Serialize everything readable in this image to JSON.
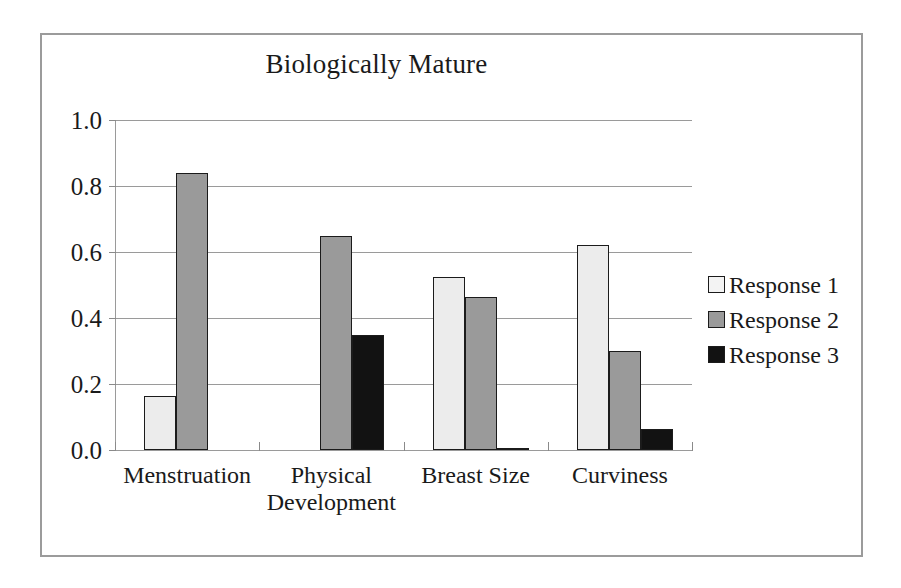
{
  "chart_data": {
    "type": "bar",
    "title": "Biologically Mature",
    "xlabel": "",
    "ylabel": "",
    "ylim": [
      0.0,
      1.0
    ],
    "ytick_labels": [
      "1.0",
      "0.8",
      "0.6",
      "0.4",
      "0.2",
      "0.0"
    ],
    "ytick_values": [
      1.0,
      0.8,
      0.6,
      0.4,
      0.2,
      0.0
    ],
    "grid": true,
    "legend_position": "right",
    "categories": [
      "Menstruation",
      "Physical\nDevelopment",
      "Breast Size",
      "Curviness"
    ],
    "series": [
      {
        "name": "Response 1",
        "color": "#ececec",
        "values": [
          0.165,
          0.0,
          0.525,
          0.62
        ]
      },
      {
        "name": "Response 2",
        "color": "#9a9a9a",
        "values": [
          0.84,
          0.65,
          0.465,
          0.3
        ]
      },
      {
        "name": "Response 3",
        "color": "#121212",
        "values": [
          0.0,
          0.35,
          0.005,
          0.065
        ]
      }
    ]
  },
  "legend": {
    "entries": [
      {
        "label": "Response 1"
      },
      {
        "label": "Response 2"
      },
      {
        "label": "Response 3"
      }
    ]
  },
  "colors": {
    "frame_border": "#9b9b9b",
    "gridline": "#9a9a9a",
    "bar_outline": "#1b1b1b",
    "text": "#1a1a1a",
    "background": "#ffffff"
  }
}
